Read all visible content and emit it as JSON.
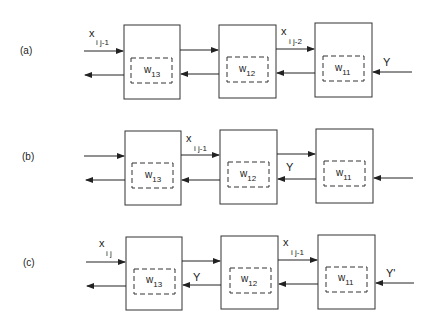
{
  "figure": {
    "rows": [
      {
        "label": "(a)",
        "blocks": [
          {
            "weight": "w",
            "weight_sub": "13"
          },
          {
            "weight": "w",
            "weight_sub": "12"
          },
          {
            "weight": "w",
            "weight_sub": "11"
          }
        ],
        "signals": {
          "input_left": {
            "main": "x",
            "sub": "i j-1"
          },
          "between_1_2": {
            "main": "",
            "sub": ""
          },
          "between_2_3": {
            "main": "x",
            "sub": "i j-2"
          },
          "right_feedback": "Y",
          "mid_feedback_label": ""
        }
      },
      {
        "label": "(b)",
        "blocks": [
          {
            "weight": "w",
            "weight_sub": "13"
          },
          {
            "weight": "w",
            "weight_sub": "12"
          },
          {
            "weight": "w",
            "weight_sub": "11"
          }
        ],
        "signals": {
          "input_left": {
            "main": "",
            "sub": ""
          },
          "between_1_2": {
            "main": "x",
            "sub": "i j-1"
          },
          "between_2_3": {
            "main": "",
            "sub": ""
          },
          "right_feedback": "",
          "mid_feedback_label": "Y"
        }
      },
      {
        "label": "(c)",
        "blocks": [
          {
            "weight": "w",
            "weight_sub": "13"
          },
          {
            "weight": "w",
            "weight_sub": "12"
          },
          {
            "weight": "w",
            "weight_sub": "11"
          }
        ],
        "signals": {
          "input_left": {
            "main": "x",
            "sub": "i j"
          },
          "between_1_2": {
            "main": "",
            "sub": ""
          },
          "between_2_3": {
            "main": "x",
            "sub": "i j-1"
          },
          "right_feedback": "Y'",
          "first_feedback_label": "Y"
        }
      }
    ]
  }
}
